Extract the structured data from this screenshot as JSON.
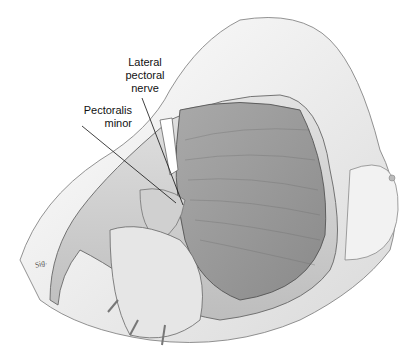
{
  "illustration": {
    "subject": "Anatomical illustration of chest wall dissection with reflected flap",
    "labels": {
      "lateral_pectoral_nerve": [
        "Lateral",
        "pectoral",
        "nerve"
      ],
      "pectoralis_minor": [
        "Pectoralis",
        "minor"
      ]
    },
    "signature": "artist signature"
  }
}
